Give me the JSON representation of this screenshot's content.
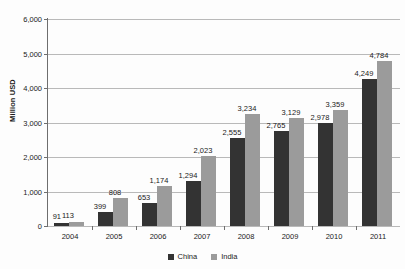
{
  "chart_data": {
    "type": "bar",
    "title": "",
    "subtitle": "",
    "xlabel": "",
    "ylabel": "Million USD",
    "ylim": [
      0,
      6000
    ],
    "ytick_labels": [
      "6,000",
      "5,000",
      "4,000",
      "3,000",
      "2,000",
      "1,000",
      "0"
    ],
    "ytick_values": [
      6000,
      5000,
      4000,
      3000,
      2000,
      1000,
      0
    ],
    "grid": true,
    "legend_position": "bottom",
    "categories": [
      "2004",
      "2005",
      "2006",
      "2007",
      "2008",
      "2009",
      "2010",
      "2011"
    ],
    "series": [
      {
        "name": "China",
        "color": "#333333",
        "values": [
          91,
          399,
          653,
          1294,
          2555,
          2765,
          2978,
          4249
        ],
        "labels": [
          "91",
          "399",
          "653",
          "1,294",
          "2,555",
          "2,765",
          "2,978",
          "4,249"
        ]
      },
      {
        "name": "India",
        "color": "#9b9b9b",
        "values": [
          113,
          808,
          1174,
          2023,
          3234,
          3129,
          3359,
          4784
        ],
        "labels": [
          "113",
          "808",
          "1,174",
          "2,023",
          "3,234",
          "3,129",
          "3,359",
          "4,784"
        ]
      }
    ],
    "legend": [
      {
        "label": "China",
        "color": "#333333"
      },
      {
        "label": "India",
        "color": "#9b9b9b"
      }
    ]
  }
}
